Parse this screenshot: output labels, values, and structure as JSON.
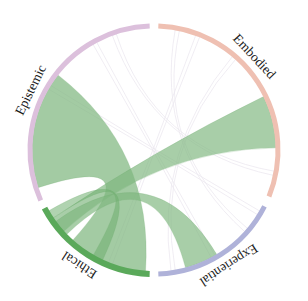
{
  "diagram": {
    "type": "chord",
    "center": [
      154,
      150
    ],
    "outer_radius": 126,
    "inner_radius": 122,
    "groups": [
      {
        "name": "Embodied",
        "color": "#efc0b2",
        "start": 2,
        "end": 112,
        "label_angle": 47
      },
      {
        "name": "Experiential",
        "color": "#afb2d9",
        "start": 117,
        "end": 178,
        "label_angle": 147
      },
      {
        "name": "Ethical",
        "color": "#5aa95a",
        "start": 182,
        "end": 242,
        "label_angle": 213
      },
      {
        "name": "Epistemic",
        "color": "#dcc0dc",
        "start": 246,
        "end": 358,
        "label_angle": 296
      }
    ],
    "chords": [
      {
        "from": "Epistemic",
        "to": "Ethical",
        "a": [
          252,
          308
        ],
        "b": [
          184,
          222
        ],
        "color": "#7fb77f",
        "opacity": 0.72
      },
      {
        "from": "Ethical",
        "to": "Embodied",
        "a": [
          228,
          236
        ],
        "b": [
          64,
          89
        ],
        "color": "#7fb77f",
        "opacity": 0.68
      },
      {
        "from": "Ethical",
        "to": "Experiential",
        "a": [
          226,
          234
        ],
        "b": [
          149,
          165
        ],
        "color": "#7fb77f",
        "opacity": 0.68
      },
      {
        "from": "Ethical",
        "to": "Ethical",
        "a": [
          236,
          240
        ],
        "b": [
          205,
          210
        ],
        "color": "#6fae6f",
        "opacity": 0.55
      }
    ],
    "faint_chords": [
      {
        "a": [
          330,
          332
        ],
        "b": [
          150,
          152
        ]
      },
      {
        "a": [
          20,
          22
        ],
        "b": [
          200,
          202
        ]
      },
      {
        "a": [
          340,
          342
        ],
        "b": [
          100,
          102
        ]
      },
      {
        "a": [
          10,
          12
        ],
        "b": [
          130,
          132
        ]
      },
      {
        "a": [
          300,
          302
        ],
        "b": [
          120,
          122
        ]
      },
      {
        "a": [
          40,
          42
        ],
        "b": [
          170,
          172
        ]
      }
    ]
  }
}
